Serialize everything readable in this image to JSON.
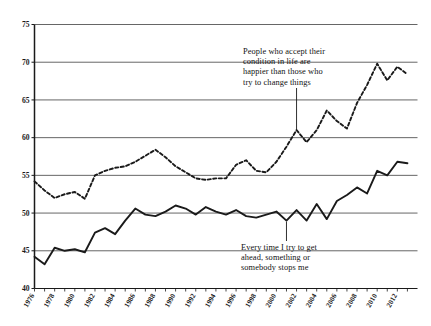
{
  "chart_data": {
    "type": "line",
    "title": "",
    "xlabel": "",
    "ylabel": "",
    "xlim": [
      1976,
      2014
    ],
    "ylim": [
      40,
      75
    ],
    "yticks": [
      40,
      45,
      50,
      55,
      60,
      65,
      70,
      75
    ],
    "xticks": [
      1976,
      1978,
      1980,
      1982,
      1984,
      1986,
      1988,
      1990,
      1992,
      1994,
      1996,
      1998,
      2000,
      2002,
      2004,
      2006,
      2008,
      2010,
      2012
    ],
    "grid": true,
    "legend_position": "none",
    "x": [
      1976,
      1977,
      1978,
      1979,
      1980,
      1981,
      1982,
      1983,
      1984,
      1985,
      1986,
      1987,
      1988,
      1989,
      1990,
      1991,
      1992,
      1993,
      1994,
      1995,
      1996,
      1997,
      1998,
      1999,
      2000,
      2001,
      2002,
      2003,
      2004,
      2005,
      2006,
      2007,
      2008,
      2009,
      2010,
      2011,
      2012,
      2013
    ],
    "series": [
      {
        "name": "People who accept their condition in life are happier than those who try to change things",
        "style": "dashed",
        "color": "#1a1a1a",
        "values": [
          54.2,
          53.0,
          52.0,
          52.5,
          52.8,
          51.9,
          55.0,
          55.6,
          56.0,
          56.2,
          56.8,
          57.6,
          58.4,
          57.4,
          56.2,
          55.4,
          54.6,
          54.4,
          54.6,
          54.6,
          56.4,
          57.0,
          55.6,
          55.4,
          56.8,
          58.8,
          61.0,
          59.4,
          61.0,
          63.6,
          62.2,
          61.2,
          64.6,
          67.0,
          69.8,
          67.6,
          69.4,
          68.4
        ]
      },
      {
        "name": "Every time I try to get ahead, something or somebody stops me",
        "style": "solid",
        "color": "#1a1a1a",
        "values": [
          44.2,
          43.2,
          45.4,
          45.0,
          45.2,
          44.8,
          47.4,
          48.0,
          47.2,
          49.0,
          50.6,
          49.8,
          49.6,
          50.2,
          51.0,
          50.6,
          49.8,
          50.8,
          50.2,
          49.8,
          50.4,
          49.6,
          49.4,
          49.8,
          50.2,
          49.0,
          50.4,
          49.0,
          51.2,
          49.2,
          51.6,
          52.4,
          53.4,
          52.6,
          55.6,
          55.0,
          56.8,
          56.6
        ]
      }
    ],
    "annotations": [
      {
        "id": "accept",
        "text": "People who accept their\ncondition in life are\nhappier than those who\ntry to change things",
        "anchor_x": 2002,
        "anchor_y": 61.0
      },
      {
        "id": "ahead",
        "text": "Every time I try to get\nahead, something or\nsomebody stops me",
        "anchor_x": 2001,
        "anchor_y": 49.0
      }
    ]
  }
}
